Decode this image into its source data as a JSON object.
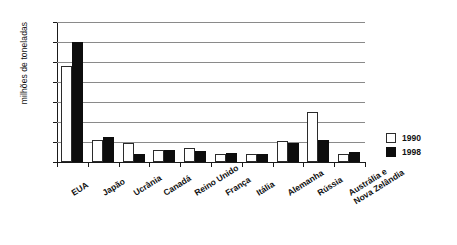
{
  "chart_data": {
    "type": "bar",
    "title": "",
    "subtitle": "",
    "xlabel": "",
    "ylabel": "milhões de toneladas",
    "ylim": [
      0,
      7000
    ],
    "y_ticks": [
      0,
      1000,
      2000,
      3000,
      4000,
      5000,
      6000,
      7000
    ],
    "y_tick_labels": [
      "0",
      "1.000",
      "2.000",
      "3.000",
      "4.000",
      "5.000",
      "6.000",
      "7.000"
    ],
    "grid": true,
    "legend_position": "right",
    "categories": [
      "EUA",
      "Japão",
      "Ucrânia",
      "Canadá",
      "Reino Unido",
      "França",
      "Itália",
      "Alemanha",
      "Rússia",
      "Austrália e\nNova Zelândia"
    ],
    "series": [
      {
        "name": "1990",
        "color": "#ffffff",
        "values": [
          4800,
          1100,
          950,
          600,
          680,
          420,
          400,
          1050,
          2500,
          400
        ]
      },
      {
        "name": "1998",
        "color": "#0d0d0d",
        "values": [
          6000,
          1250,
          400,
          620,
          560,
          430,
          420,
          950,
          1100,
          500
        ]
      }
    ]
  },
  "legend": {
    "items": [
      {
        "label": "1990",
        "swatch": "white-square"
      },
      {
        "label": "1998",
        "swatch": "black-square"
      }
    ]
  },
  "colors": {
    "series_1990": "#ffffff",
    "series_1998": "#0d0d0d",
    "gridline": "#8a8a8a",
    "axis": "#1a1a1a",
    "text": "#111111",
    "background": "#ffffff"
  }
}
